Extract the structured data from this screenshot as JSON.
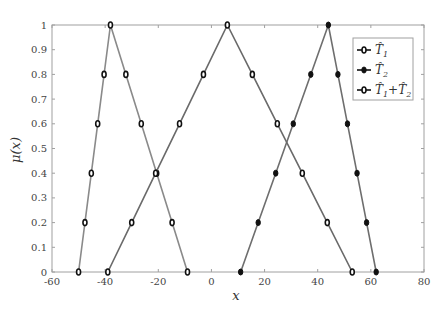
{
  "chart_data": {
    "type": "line",
    "title": "",
    "xlabel": "x",
    "ylabel": "μ(x)",
    "xlim": [
      -60,
      80
    ],
    "ylim": [
      0,
      1
    ],
    "xticks": [
      -60,
      -40,
      -20,
      0,
      20,
      40,
      60,
      80
    ],
    "yticks": [
      0,
      0.1,
      0.2,
      0.3,
      0.4,
      0.5,
      0.6,
      0.7,
      0.8,
      0.9,
      1
    ],
    "grid": false,
    "legend_position": "upper right",
    "series": [
      {
        "name": "T̂1",
        "legend_main": "T̂",
        "legend_sub": "1",
        "marker": "open-circle",
        "line_color": "#8a8a8a",
        "triangle": [
          -50,
          -38,
          -9
        ],
        "x": [
          -50,
          -47.6,
          -45.2,
          -42.8,
          -40.4,
          -38,
          -32.2,
          -26.4,
          -20.6,
          -14.8,
          -9
        ],
        "y": [
          0,
          0.2,
          0.4,
          0.6,
          0.8,
          1,
          0.8,
          0.6,
          0.4,
          0.2,
          0
        ]
      },
      {
        "name": "T̂2",
        "legend_main": "T̂",
        "legend_sub": "2",
        "marker": "filled-dot",
        "line_color": "#6e6e6e",
        "triangle": [
          11,
          44,
          62
        ],
        "x": [
          11,
          17.6,
          24.2,
          30.8,
          37.4,
          44,
          47.6,
          51.2,
          54.8,
          58.4,
          62
        ],
        "y": [
          0,
          0.2,
          0.4,
          0.6,
          0.8,
          1,
          0.8,
          0.6,
          0.4,
          0.2,
          0
        ]
      },
      {
        "name": "T̂1+T̂2",
        "legend_main": "T̂",
        "legend_sub": "1",
        "legend_plus": "+",
        "legend_main2": "T̂",
        "legend_sub2": "2",
        "marker": "open-circle",
        "line_color": "#6a6a6a",
        "triangle": [
          -39,
          6,
          53
        ],
        "x": [
          -39,
          -30,
          -21,
          -12,
          -3,
          6,
          15.4,
          24.8,
          34.2,
          43.6,
          53
        ],
        "y": [
          0,
          0.2,
          0.4,
          0.6,
          0.8,
          1,
          0.8,
          0.6,
          0.4,
          0.2,
          0
        ]
      }
    ]
  },
  "labels": {
    "xlabel": "x",
    "ylabel": "μ(x)"
  }
}
